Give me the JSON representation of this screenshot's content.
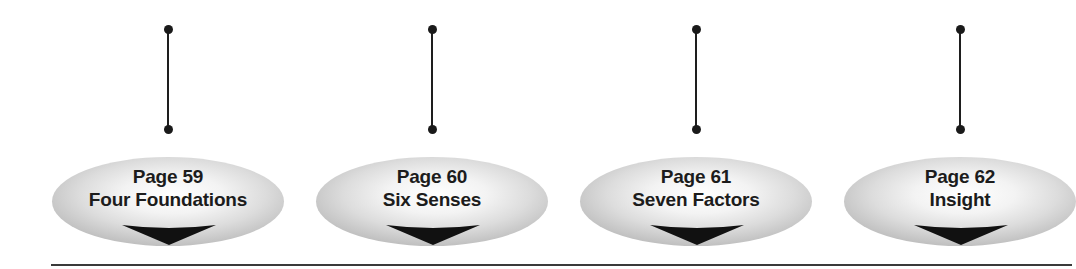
{
  "diagram": {
    "type": "page-reference-navigation",
    "nodes": [
      {
        "page": "Page 59",
        "title": "Four Foundations",
        "center_x": 168
      },
      {
        "page": "Page 60",
        "title": "Six Senses",
        "center_x": 432
      },
      {
        "page": "Page 61",
        "title": "Seven Factors",
        "center_x": 696
      },
      {
        "page": "Page 62",
        "title": "Insight",
        "center_x": 960
      }
    ],
    "colors": {
      "text": "#1c1c1c",
      "connector": "#1e1e1e",
      "arrow": "#111111",
      "baseline": "#3a3a3a",
      "ellipse_edge": "#b9b9b9",
      "ellipse_center": "#ffffff"
    },
    "icons": {
      "connector_end": "dot-icon",
      "pointer": "down-arrow-icon"
    }
  }
}
